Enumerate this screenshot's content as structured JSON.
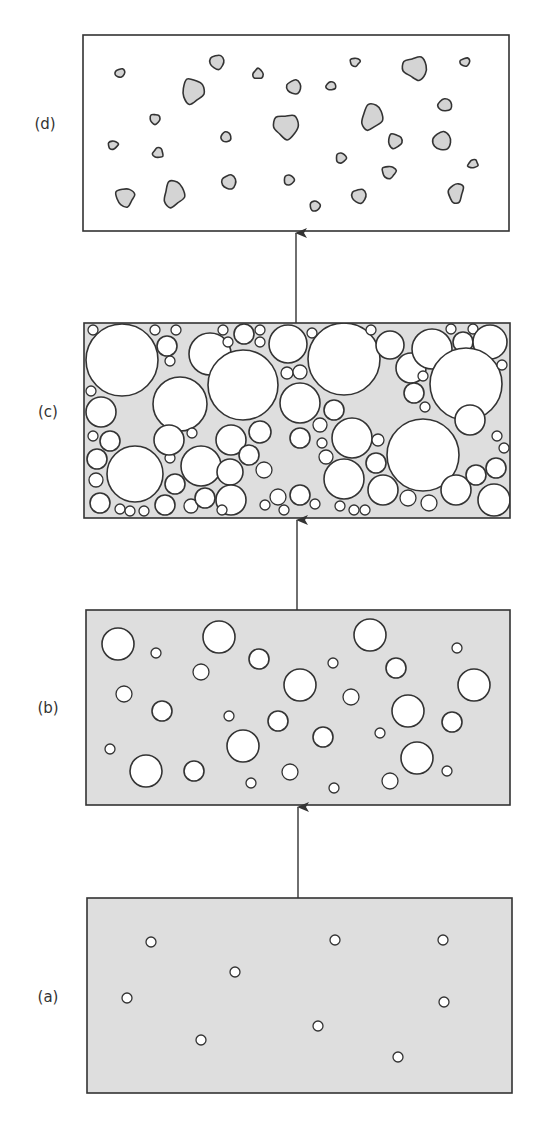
{
  "colors": {
    "background": "#ffffff",
    "stroke": "#333333",
    "matrix_gray": "#dedede",
    "particle_gray": "#d4d4d4",
    "void_white": "#ffffff"
  },
  "panels": [
    {
      "id": "a",
      "label": "(a)",
      "label_pos": [
        48,
        1002
      ],
      "box": [
        87,
        898,
        425,
        195
      ],
      "fill": "#dedede",
      "shape_fill": "#ffffff",
      "description": "Gray matrix with sparse small white voids",
      "circles": [
        [
          151,
          942,
          5
        ],
        [
          235,
          972,
          5
        ],
        [
          127,
          998,
          5
        ],
        [
          201,
          1040,
          5
        ],
        [
          335,
          940,
          5
        ],
        [
          318,
          1026,
          5
        ],
        [
          443,
          940,
          5
        ],
        [
          444,
          1002,
          5
        ],
        [
          398,
          1057,
          5
        ]
      ]
    },
    {
      "id": "b",
      "label": "(b)",
      "label_pos": [
        48,
        713
      ],
      "box": [
        86,
        610,
        424,
        195
      ],
      "fill": "#dedede",
      "shape_fill": "#ffffff",
      "description": "Gray matrix with growing white voids of varied size",
      "circles": [
        [
          118,
          644,
          16
        ],
        [
          156,
          653,
          5
        ],
        [
          219,
          637,
          16
        ],
        [
          259,
          659,
          10
        ],
        [
          201,
          672,
          8
        ],
        [
          124,
          694,
          8
        ],
        [
          162,
          711,
          10
        ],
        [
          229,
          716,
          5
        ],
        [
          243,
          746,
          16
        ],
        [
          278,
          721,
          10
        ],
        [
          300,
          685,
          16
        ],
        [
          333,
          663,
          5
        ],
        [
          351,
          697,
          8
        ],
        [
          323,
          737,
          10
        ],
        [
          370,
          635,
          16
        ],
        [
          396,
          668,
          10
        ],
        [
          408,
          711,
          16
        ],
        [
          380,
          733,
          5
        ],
        [
          457,
          648,
          5
        ],
        [
          474,
          685,
          16
        ],
        [
          452,
          722,
          10
        ],
        [
          417,
          758,
          16
        ],
        [
          447,
          771,
          5
        ],
        [
          390,
          781,
          8
        ],
        [
          334,
          788,
          5
        ],
        [
          290,
          772,
          8
        ],
        [
          251,
          783,
          5
        ],
        [
          194,
          771,
          10
        ],
        [
          146,
          771,
          16
        ],
        [
          110,
          749,
          5
        ]
      ]
    },
    {
      "id": "c",
      "label": "(c)",
      "label_pos": [
        48,
        417
      ],
      "box": [
        84,
        323,
        426,
        195
      ],
      "fill": "#dedede",
      "shape_fill": "#ffffff",
      "description": "Densely packed white voids with thin gray matrix between",
      "circles": [
        [
          122,
          360,
          36
        ],
        [
          93,
          330,
          5
        ],
        [
          155,
          330,
          5
        ],
        [
          176,
          330,
          5
        ],
        [
          167,
          346,
          10
        ],
        [
          170,
          361,
          5
        ],
        [
          210,
          354,
          21
        ],
        [
          180,
          404,
          27
        ],
        [
          91,
          391,
          5
        ],
        [
          223,
          330,
          5
        ],
        [
          228,
          342,
          5
        ],
        [
          244,
          334,
          10
        ],
        [
          260,
          330,
          5
        ],
        [
          260,
          342,
          5
        ],
        [
          243,
          385,
          35
        ],
        [
          288,
          344,
          19
        ],
        [
          312,
          333,
          5
        ],
        [
          287,
          373,
          6
        ],
        [
          300,
          372,
          7
        ],
        [
          300,
          403,
          20
        ],
        [
          334,
          410,
          10
        ],
        [
          344,
          359,
          36
        ],
        [
          371,
          330,
          5
        ],
        [
          390,
          345,
          14
        ],
        [
          411,
          368,
          15
        ],
        [
          432,
          349,
          20
        ],
        [
          451,
          329,
          5
        ],
        [
          463,
          342,
          10
        ],
        [
          473,
          329,
          5
        ],
        [
          490,
          342,
          17
        ],
        [
          466,
          384,
          36
        ],
        [
          502,
          365,
          5
        ],
        [
          423,
          376,
          5
        ],
        [
          414,
          393,
          10
        ],
        [
          425,
          407,
          5
        ],
        [
          101,
          412,
          15
        ],
        [
          93,
          436,
          5
        ],
        [
          110,
          441,
          10
        ],
        [
          97,
          459,
          10
        ],
        [
          135,
          474,
          28
        ],
        [
          96,
          480,
          7
        ],
        [
          100,
          503,
          10
        ],
        [
          120,
          509,
          5
        ],
        [
          130,
          511,
          5
        ],
        [
          144,
          511,
          5
        ],
        [
          165,
          505,
          10
        ],
        [
          170,
          458,
          5
        ],
        [
          175,
          484,
          10
        ],
        [
          169,
          440,
          15
        ],
        [
          201,
          466,
          20
        ],
        [
          191,
          506,
          7
        ],
        [
          205,
          498,
          10
        ],
        [
          192,
          433,
          5
        ],
        [
          231,
          440,
          15
        ],
        [
          230,
          472,
          13
        ],
        [
          231,
          500,
          15
        ],
        [
          222,
          510,
          5
        ],
        [
          260,
          432,
          11
        ],
        [
          249,
          455,
          10
        ],
        [
          264,
          470,
          8
        ],
        [
          300,
          438,
          10
        ],
        [
          320,
          425,
          7
        ],
        [
          322,
          443,
          5
        ],
        [
          326,
          457,
          7
        ],
        [
          352,
          438,
          20
        ],
        [
          423,
          455,
          36
        ],
        [
          378,
          440,
          6
        ],
        [
          376,
          463,
          10
        ],
        [
          344,
          479,
          20
        ],
        [
          383,
          490,
          15
        ],
        [
          408,
          498,
          8
        ],
        [
          429,
          503,
          8
        ],
        [
          456,
          490,
          15
        ],
        [
          470,
          420,
          15
        ],
        [
          497,
          436,
          5
        ],
        [
          504,
          448,
          5
        ],
        [
          496,
          468,
          10
        ],
        [
          476,
          475,
          10
        ],
        [
          494,
          500,
          16
        ],
        [
          300,
          495,
          10
        ],
        [
          315,
          504,
          5
        ],
        [
          340,
          506,
          5
        ],
        [
          354,
          510,
          5
        ],
        [
          365,
          510,
          5
        ],
        [
          278,
          497,
          8
        ],
        [
          265,
          505,
          5
        ],
        [
          284,
          510,
          5
        ]
      ]
    },
    {
      "id": "d",
      "label": "(d)",
      "label_pos": [
        45,
        129
      ],
      "box": [
        83,
        35,
        426,
        196
      ],
      "fill": "#ffffff",
      "shape_fill": "#d4d4d4",
      "description": "White field with isolated irregular gray particles",
      "blobs": [
        [
          120,
          73,
          5,
          4,
          -20
        ],
        [
          217,
          62,
          7,
          7,
          30
        ],
        [
          193,
          91,
          11,
          12,
          15
        ],
        [
          258,
          74,
          5,
          5,
          0
        ],
        [
          294,
          87,
          7,
          7,
          -30
        ],
        [
          331,
          86,
          5,
          4,
          -10
        ],
        [
          355,
          62,
          5,
          4,
          -10
        ],
        [
          415,
          68,
          12,
          11,
          30
        ],
        [
          465,
          62,
          5,
          4,
          -20
        ],
        [
          445,
          105,
          7,
          6,
          -5
        ],
        [
          372,
          117,
          10,
          13,
          20
        ],
        [
          286,
          126,
          12,
          12,
          40
        ],
        [
          155,
          119,
          5,
          5,
          0
        ],
        [
          226,
          137,
          5,
          5,
          -10
        ],
        [
          113,
          145,
          5,
          4,
          -10
        ],
        [
          158,
          153,
          5,
          5,
          -10
        ],
        [
          395,
          141,
          7,
          7,
          15
        ],
        [
          442,
          141,
          9,
          9,
          10
        ],
        [
          341,
          158,
          5,
          5,
          0
        ],
        [
          473,
          164,
          5,
          4,
          -20
        ],
        [
          389,
          172,
          7,
          6,
          -10
        ],
        [
          229,
          182,
          7,
          7,
          20
        ],
        [
          289,
          180,
          5,
          5,
          0
        ],
        [
          125,
          197,
          9,
          9,
          30
        ],
        [
          174,
          194,
          10,
          13,
          15
        ],
        [
          359,
          196,
          7,
          7,
          30
        ],
        [
          315,
          206,
          5,
          5,
          -10
        ],
        [
          456,
          193,
          7,
          10,
          15
        ]
      ]
    }
  ],
  "arrows": [
    {
      "from": "a",
      "to": "b",
      "x": 298,
      "y1": 898,
      "y2": 806
    },
    {
      "from": "b",
      "to": "c",
      "x": 297,
      "y1": 610,
      "y2": 519
    },
    {
      "from": "c",
      "to": "d",
      "x": 296,
      "y1": 323,
      "y2": 232
    }
  ]
}
